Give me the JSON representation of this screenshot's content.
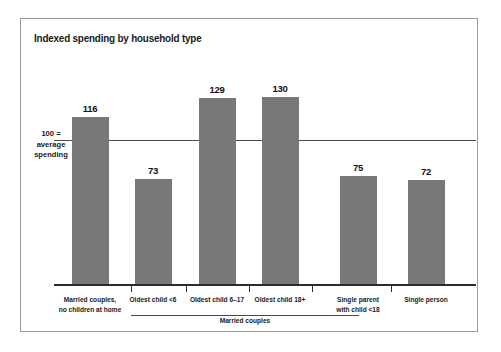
{
  "chart_data": {
    "type": "bar",
    "title": "Indexed spending by household type",
    "xlabel": "",
    "ylabel": "",
    "categories": [
      "Married couples,\nno children at home",
      "Oldest child <6",
      "Oldest child 6–17",
      "Oldest child 18+",
      "Single parent\nwith child <18",
      "Single person"
    ],
    "values": [
      116,
      73,
      129,
      130,
      75,
      72
    ],
    "value_labels": [
      "116",
      "73",
      "129",
      "130",
      "75",
      "72"
    ],
    "reference_line": {
      "value": 100,
      "label_line1": "100 =",
      "label_line2": "average",
      "label_line3": "spending"
    },
    "group_bracket": {
      "label": "Married couples",
      "covers": [
        "Oldest child <6",
        "Oldest child 6–17",
        "Oldest child 18+"
      ]
    },
    "ylim": [
      0,
      145
    ],
    "grid": false,
    "legend": "none",
    "bar_color": "#787878",
    "frame_color": "#9a9a9a",
    "axis_color": "#2b2b2b"
  }
}
